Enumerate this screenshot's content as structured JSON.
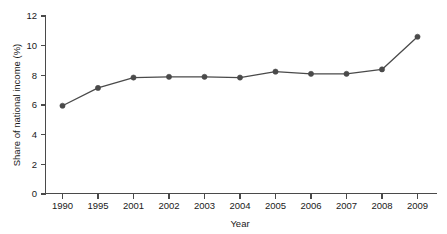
{
  "chart_data": {
    "type": "line",
    "title": "",
    "xlabel": "Year",
    "ylabel": "Share of national income (%)",
    "categories": [
      "1990",
      "1995",
      "2001",
      "2002",
      "2003",
      "2004",
      "2005",
      "2006",
      "2007",
      "2008",
      "2009"
    ],
    "values": [
      5.95,
      7.15,
      7.85,
      7.9,
      7.9,
      7.85,
      8.25,
      8.1,
      8.1,
      8.4,
      10.6
    ],
    "series": [
      {
        "name": "Share of national income (%)",
        "values": [
          5.95,
          7.15,
          7.85,
          7.9,
          7.9,
          7.85,
          8.25,
          8.1,
          8.1,
          8.4,
          10.6
        ]
      }
    ],
    "ylim": [
      0,
      12
    ],
    "yticks": [
      "0",
      "2",
      "4",
      "6",
      "8",
      "10",
      "12"
    ],
    "ytick_values": [
      0,
      2,
      4,
      6,
      8,
      10,
      12
    ],
    "xticks": [
      "1990",
      "1995",
      "2001",
      "2002",
      "2003",
      "2004",
      "2005",
      "2006",
      "2007",
      "2008",
      "2009"
    ],
    "grid": false,
    "legend": "none",
    "marker": "circle",
    "line_color": "#4a4a4a",
    "marker_color": "#4a4a4a",
    "background_color": "#ffffff"
  },
  "axes": {
    "y_axis_title": "Share of national income (%)",
    "x_axis_title": "Year"
  }
}
